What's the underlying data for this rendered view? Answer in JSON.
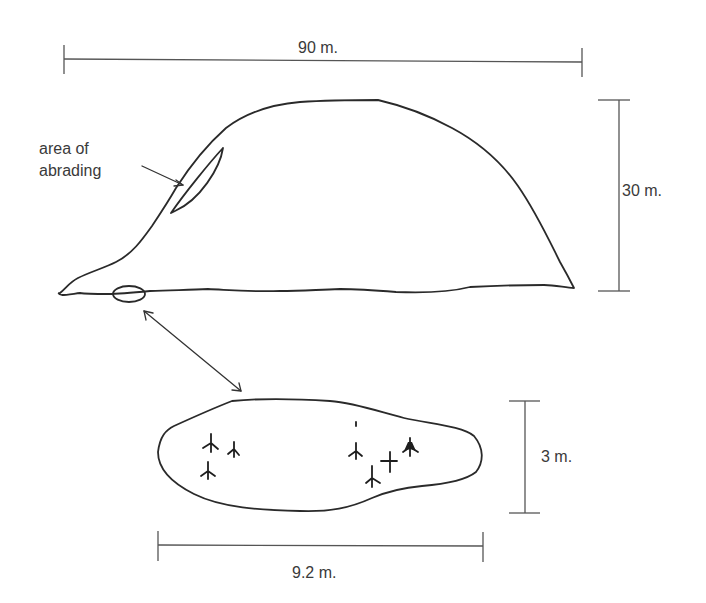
{
  "diagram": {
    "type": "rock outcrop profile and boulder plan sketch",
    "colors": {
      "line": "#2a2a2a",
      "scale": "#555555",
      "text": "#3a3a3a",
      "background": "#ffffff"
    },
    "outcrop": {
      "name": "rock outcrop profile",
      "scale_width": {
        "label": "90 m.",
        "value": 90,
        "unit": "m"
      },
      "scale_height": {
        "label": "30 m.",
        "value": 30,
        "unit": "m"
      },
      "annotation": {
        "line1": "area of",
        "line2": "abrading"
      }
    },
    "boulder": {
      "name": "boulder plan view with petroglyphs",
      "scale_width": {
        "label": "9.2 m.",
        "value": 9.2,
        "unit": "m"
      },
      "scale_height": {
        "label": "3 m.",
        "value": 3,
        "unit": "m"
      },
      "glyph_count": 8,
      "glyph_description": "bird-track (three-toed) petroglyphs"
    },
    "connector": {
      "description": "double-headed arrow linking the small boulder at the outcrop base to its enlarged plan view"
    }
  }
}
